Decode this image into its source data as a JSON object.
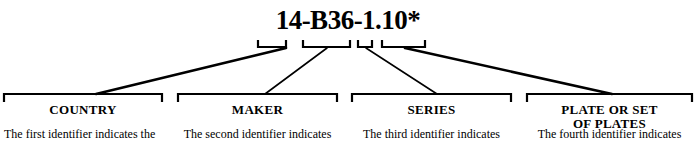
{
  "figure": {
    "code": "14-B36-1.10*",
    "ink_color": "#000000",
    "background_color": "#ffffff",
    "segments": [
      {
        "id": "country",
        "code_part": "14",
        "label": "COUNTRY",
        "label_line2": "",
        "description": "The first identifier indicates the"
      },
      {
        "id": "maker",
        "code_part": "B36",
        "label": "MAKER",
        "label_line2": "",
        "description": "The second identifier indicates"
      },
      {
        "id": "series",
        "code_part": "1",
        "label": "SERIES",
        "label_line2": "",
        "description": "The third  identifier  indicates"
      },
      {
        "id": "plate",
        "code_part": "10",
        "label": "PLATE OR SET",
        "label_line2": "OF PLATES",
        "description": "The fourth identifier indicates"
      }
    ]
  }
}
